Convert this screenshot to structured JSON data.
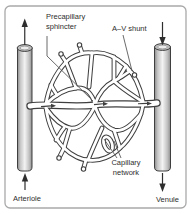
{
  "diagram": {
    "labels": {
      "precapillary_sphincter_line1": "Precapillary",
      "precapillary_sphincter_line2": "sphincter",
      "av_shunt": "A–V shunt",
      "capillary_network_line1": "Capillary",
      "capillary_network_line2": "network",
      "arteriole": "Arteriole",
      "venule": "Venule"
    },
    "colors": {
      "outline": "#3f3f3f",
      "frame_border": "#a9a9a9",
      "background": "#ffffff",
      "tube_shade_dark": "#8c8c8c",
      "tube_shade_light": "#f3f3f3",
      "label_text": "#2e2e2e"
    }
  }
}
